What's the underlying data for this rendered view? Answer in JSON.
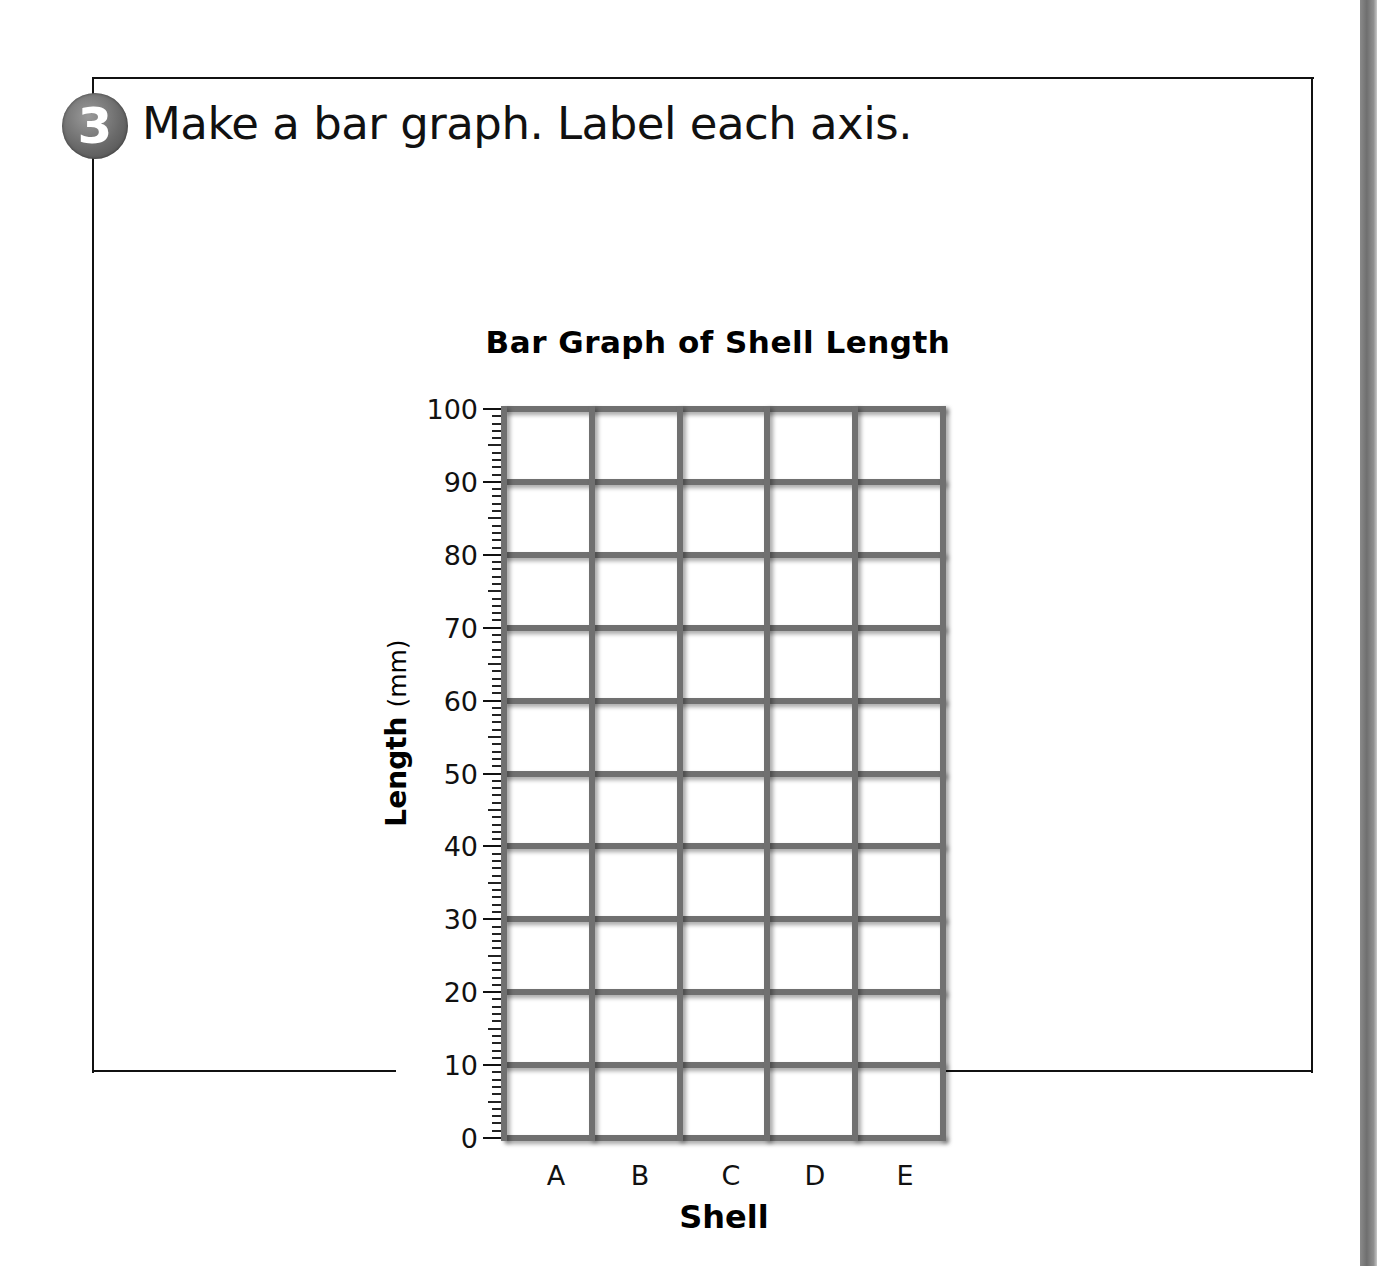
{
  "problem": {
    "number": "3",
    "instruction": "Make a bar graph. Label each axis."
  },
  "chart_data": {
    "type": "bar",
    "title": "Bar Graph of Shell Length",
    "xlabel": "Shell",
    "ylabel": "Length",
    "ylabel_unit": "(mm)",
    "categories": [
      "A",
      "B",
      "C",
      "D",
      "E"
    ],
    "values": [
      null,
      null,
      null,
      null,
      null
    ],
    "ylim": [
      0,
      100
    ],
    "yticks": [
      0,
      10,
      20,
      30,
      40,
      50,
      60,
      70,
      80,
      90,
      100
    ],
    "minor_tick_step": 1,
    "grid": true,
    "legend": null,
    "note": "Empty blank bar graph grid for student to fill in; no bars drawn"
  },
  "colors": {
    "grid_line": "#707070",
    "frame": "#111111",
    "badge": "#6a6a6a",
    "text": "#111111"
  }
}
